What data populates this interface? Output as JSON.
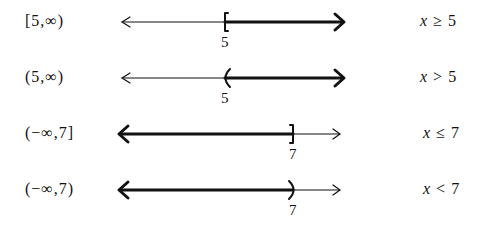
{
  "rows": [
    {
      "interval": "[5,∞)",
      "var": "x",
      "op": "≥",
      "val": "5",
      "endpoint_label": "5",
      "endpoint_x": 225,
      "endpoint_type": "closed",
      "direction": "right"
    },
    {
      "interval": "(5,∞)",
      "var": "x",
      "op": ">",
      "val": "5",
      "endpoint_label": "5",
      "endpoint_x": 225,
      "endpoint_type": "open",
      "direction": "right"
    },
    {
      "interval": "(−∞,7]",
      "var": "x",
      "op": "≤",
      "val": "7",
      "endpoint_label": "7",
      "endpoint_x": 293,
      "endpoint_type": "closed",
      "direction": "left"
    },
    {
      "interval": "(−∞,7)",
      "var": "x",
      "op": "<",
      "val": "7",
      "endpoint_label": "7",
      "endpoint_x": 293,
      "endpoint_type": "open",
      "direction": "left"
    }
  ]
}
